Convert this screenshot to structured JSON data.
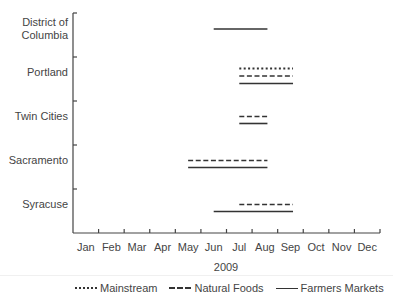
{
  "chart_data": {
    "type": "gantt-range",
    "title": "",
    "xlabel": "2009",
    "ylabel": "",
    "x_ticks": [
      "Jan",
      "Feb",
      "Mar",
      "Apr",
      "May",
      "Jun",
      "Jul",
      "Aug",
      "Sep",
      "Oct",
      "Nov",
      "Dec"
    ],
    "categories": [
      "District of Columbia",
      "Portland",
      "Twin Cities",
      "Sacramento",
      "Syracuse"
    ],
    "legend": [
      {
        "name": "Mainstream",
        "style": "dotted"
      },
      {
        "name": "Natural Foods",
        "style": "dashed"
      },
      {
        "name": "Farmers Markets",
        "style": "solid"
      }
    ],
    "legend_position": "bottom",
    "grid": false,
    "x_range_months": [
      0,
      12
    ],
    "series": [
      {
        "category": "District of Columbia",
        "name": "Farmers Markets",
        "start_month": 5.5,
        "end_month": 7.6
      },
      {
        "category": "Portland",
        "name": "Mainstream",
        "start_month": 6.5,
        "end_month": 8.6
      },
      {
        "category": "Portland",
        "name": "Natural Foods",
        "start_month": 6.5,
        "end_month": 8.6
      },
      {
        "category": "Portland",
        "name": "Farmers Markets",
        "start_month": 6.5,
        "end_month": 8.6
      },
      {
        "category": "Twin Cities",
        "name": "Natural Foods",
        "start_month": 6.5,
        "end_month": 7.6
      },
      {
        "category": "Twin Cities",
        "name": "Farmers Markets",
        "start_month": 6.5,
        "end_month": 7.6
      },
      {
        "category": "Sacramento",
        "name": "Natural Foods",
        "start_month": 4.5,
        "end_month": 7.6
      },
      {
        "category": "Sacramento",
        "name": "Farmers Markets",
        "start_month": 4.5,
        "end_month": 7.6
      },
      {
        "category": "Syracuse",
        "name": "Natural Foods",
        "start_month": 6.5,
        "end_month": 8.6
      },
      {
        "category": "Syracuse",
        "name": "Farmers Markets",
        "start_month": 5.5,
        "end_month": 8.6
      }
    ]
  },
  "labels": {
    "y": [
      "District of\nColumbia",
      "Portland",
      "Twin Cities",
      "Sacramento",
      "Syracuse"
    ],
    "x": [
      "Jan",
      "Feb",
      "Mar",
      "Apr",
      "May",
      "Jun",
      "Jul",
      "Aug",
      "Sep",
      "Oct",
      "Nov",
      "Dec"
    ],
    "x_title": "2009",
    "legend": [
      "Mainstream",
      "Natural Foods",
      "Farmers Markets"
    ]
  }
}
